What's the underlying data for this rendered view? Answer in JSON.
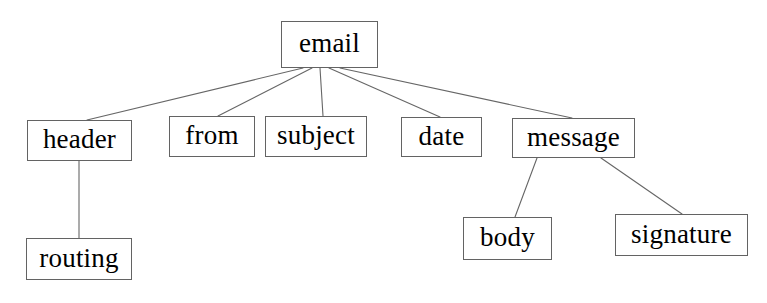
{
  "diagram": {
    "type": "tree",
    "title": "email",
    "canvas": {
      "width": 767,
      "height": 303,
      "background": "#ffffff"
    },
    "style": {
      "node_border_color": "#636363",
      "node_fill": "#ffffff",
      "edge_color": "#666666",
      "text_color": "#000000",
      "edge_width": 1
    },
    "nodes": [
      {
        "id": "email",
        "label": "email"
      },
      {
        "id": "header",
        "label": "header"
      },
      {
        "id": "from",
        "label": "from"
      },
      {
        "id": "subject",
        "label": "subject"
      },
      {
        "id": "date",
        "label": "date"
      },
      {
        "id": "message",
        "label": "message"
      },
      {
        "id": "routing",
        "label": "routing"
      },
      {
        "id": "body",
        "label": "body"
      },
      {
        "id": "signature",
        "label": "signature"
      }
    ],
    "edges": [
      {
        "from": "email",
        "to": "header"
      },
      {
        "from": "email",
        "to": "from"
      },
      {
        "from": "email",
        "to": "subject"
      },
      {
        "from": "email",
        "to": "date"
      },
      {
        "from": "email",
        "to": "message"
      },
      {
        "from": "header",
        "to": "routing"
      },
      {
        "from": "message",
        "to": "body"
      },
      {
        "from": "message",
        "to": "signature"
      }
    ]
  }
}
